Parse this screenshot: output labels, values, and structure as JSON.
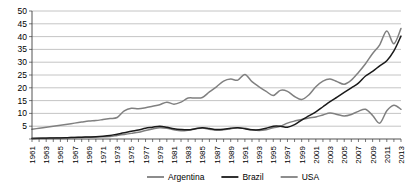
{
  "chart_data": {
    "type": "line",
    "title": "",
    "xlabel": "",
    "ylabel": "",
    "ylim": [
      0,
      50
    ],
    "ytick_step": 5,
    "yticks": [
      "5",
      "10",
      "15",
      "20",
      "25",
      "30",
      "35",
      "40",
      "45",
      "50"
    ],
    "grid": true,
    "legend_position": "bottom",
    "xtick_step": 2,
    "x": [
      1961,
      1962,
      1963,
      1964,
      1965,
      1966,
      1967,
      1968,
      1969,
      1970,
      1971,
      1972,
      1973,
      1974,
      1975,
      1976,
      1977,
      1978,
      1979,
      1980,
      1981,
      1982,
      1983,
      1984,
      1985,
      1986,
      1987,
      1988,
      1989,
      1990,
      1991,
      1992,
      1993,
      1994,
      1995,
      1996,
      1997,
      1998,
      1999,
      2000,
      2001,
      2002,
      2003,
      2004,
      2005,
      2006,
      2007,
      2008,
      2009,
      2010,
      2011,
      2012,
      2013
    ],
    "xticklabels": [
      "1961",
      "1963",
      "1965",
      "1967",
      "1969",
      "1971",
      "1973",
      "1975",
      "1977",
      "1979",
      "1981",
      "1983",
      "1985",
      "1987",
      "1989",
      "1991",
      "1993",
      "1995",
      "1997",
      "1999",
      "2001",
      "2003",
      "2005",
      "2007",
      "2009",
      "2011",
      "2013"
    ],
    "series": [
      {
        "name": "Argentina",
        "color": "#7f7f7f",
        "width": 1.5,
        "values": [
          0.3,
          0.3,
          0.4,
          0.4,
          0.5,
          0.5,
          0.6,
          0.6,
          0.7,
          0.8,
          0.9,
          1.0,
          1.4,
          1.8,
          2.2,
          2.6,
          3.3,
          3.9,
          4.4,
          4.2,
          3.6,
          3.2,
          3.4,
          3.9,
          4.3,
          3.8,
          3.4,
          3.6,
          4.0,
          4.4,
          4.2,
          3.6,
          3.3,
          3.6,
          4.4,
          5.0,
          6.2,
          7.0,
          7.6,
          8.2,
          8.6,
          9.4,
          10.2,
          9.6,
          9.0,
          9.6,
          10.8,
          11.6,
          9.2,
          6.2,
          11.0,
          13.2,
          11.6
        ]
      },
      {
        "name": "Brazil",
        "color": "#1a1a1a",
        "width": 1.5,
        "values": [
          0.2,
          0.3,
          0.3,
          0.4,
          0.4,
          0.5,
          0.6,
          0.7,
          0.8,
          0.9,
          1.1,
          1.4,
          1.9,
          2.4,
          3.0,
          3.5,
          4.2,
          4.6,
          5.0,
          4.6,
          4.0,
          3.7,
          3.6,
          4.0,
          4.4,
          4.1,
          3.7,
          3.8,
          4.2,
          4.4,
          4.0,
          3.6,
          3.6,
          4.2,
          5.0,
          5.0,
          4.6,
          5.6,
          7.4,
          9.0,
          10.6,
          12.6,
          14.6,
          16.4,
          18.2,
          20.0,
          21.8,
          24.6,
          26.4,
          28.6,
          30.6,
          34.4,
          40.2
        ]
      },
      {
        "name": "USA",
        "color": "#808080",
        "width": 1.5,
        "values": [
          3.8,
          4.2,
          4.6,
          5.0,
          5.4,
          5.8,
          6.2,
          6.6,
          7.0,
          7.2,
          7.6,
          8.0,
          8.4,
          11.0,
          12.0,
          11.8,
          12.2,
          12.8,
          13.4,
          14.4,
          13.6,
          14.4,
          16.0,
          16.0,
          16.2,
          18.4,
          20.4,
          22.6,
          23.4,
          23.0,
          25.2,
          22.4,
          20.4,
          18.6,
          17.0,
          19.0,
          18.6,
          16.6,
          15.4,
          17.2,
          20.4,
          22.6,
          23.4,
          22.4,
          21.4,
          23.0,
          26.0,
          29.4,
          33.4,
          36.8,
          42.2,
          37.2,
          43.2
        ]
      }
    ]
  },
  "legend": {
    "items": [
      {
        "label": "Argentina"
      },
      {
        "label": "Brazil"
      },
      {
        "label": "USA"
      }
    ]
  }
}
